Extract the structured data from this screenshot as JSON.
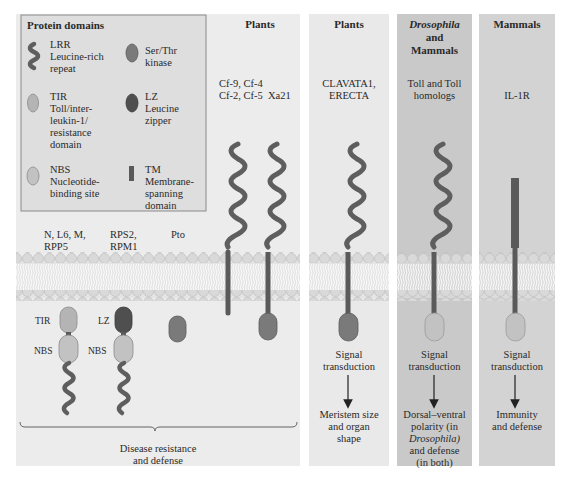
{
  "legend": {
    "title": "Protein domains",
    "items": [
      {
        "icon": "lrr-coil-icon",
        "abbr": "LRR",
        "name_lines": [
          "Leucine-rich",
          "repeat"
        ],
        "color": "#5e5e5e"
      },
      {
        "icon": "kinase-oval-icon",
        "abbr": "Ser/Thr",
        "name_lines": [
          "kinase"
        ],
        "color": "#7a7a7a"
      },
      {
        "icon": "tir-oval-icon",
        "abbr": "TIR",
        "name_lines": [
          "Toll/inter-",
          "leukin-1/",
          "resistance",
          "domain"
        ],
        "color": "#b4b4b4"
      },
      {
        "icon": "lz-oval-icon",
        "abbr": "LZ",
        "name_lines": [
          "Leucine",
          "zipper"
        ],
        "color": "#4f4f4f"
      },
      {
        "icon": "nbs-oval-icon",
        "abbr": "NBS",
        "name_lines": [
          "Nucleotide-",
          "binding site"
        ],
        "color": "#c2c2c2"
      },
      {
        "icon": "tm-bar-icon",
        "abbr": "TM",
        "name_lines": [
          "Membrane-",
          "spanning",
          "domain"
        ],
        "color": "#5a5a5a"
      }
    ]
  },
  "panels": [
    {
      "header": "Plants",
      "proteins": [
        {
          "label_lines": [
            "N, L6, M,",
            "RPP5"
          ],
          "domains": [
            "TIR",
            "NBS",
            "LRR"
          ],
          "domain_labels": [
            "TIR",
            "NBS"
          ]
        },
        {
          "label_lines": [
            "RPS2,",
            "RPM1"
          ],
          "domains": [
            "LZ",
            "NBS",
            "LRR"
          ],
          "domain_labels": [
            "LZ",
            "NBS"
          ]
        },
        {
          "label_lines": [
            "Pto"
          ],
          "domains": [
            "Ser/Thr kinase"
          ]
        },
        {
          "label_lines": [
            "Cf-9, Cf-4",
            "Cf-2, Cf-5"
          ],
          "domains": [
            "LRR",
            "TM"
          ]
        },
        {
          "label_lines": [
            "Xa21"
          ],
          "domains": [
            "LRR",
            "TM",
            "Ser/Thr kinase"
          ]
        }
      ],
      "function_lines": [
        "Disease resistance",
        "and defense"
      ]
    },
    {
      "header": "Plants",
      "proteins": [
        {
          "label_lines": [
            "CLAVATA1,",
            "ERECTA"
          ],
          "domains": [
            "LRR",
            "TM",
            "Ser/Thr kinase"
          ]
        }
      ],
      "signal_lines": [
        "Signal",
        "transduction"
      ],
      "function_lines": [
        "Meristem size",
        "and organ",
        "shape"
      ]
    },
    {
      "header_italic": "Drosophila",
      "header_lines": [
        "and",
        "Mammals"
      ],
      "proteins": [
        {
          "label_lines": [
            "Toll and Toll",
            "homologs"
          ],
          "domains": [
            "LRR",
            "TM",
            "TIR"
          ]
        }
      ],
      "signal_lines": [
        "Signal",
        "transduction"
      ],
      "function_lines": [
        "Dorsal–ventral",
        "polarity (in",
        "Drosophila)",
        "and defense",
        "(in both)"
      ]
    },
    {
      "header": "Mammals",
      "proteins": [
        {
          "label_lines": [
            "IL-1R"
          ],
          "domains": [
            "TM",
            "TIR"
          ]
        }
      ],
      "signal_lines": [
        "Signal",
        "transduction"
      ],
      "function_lines": [
        "Immunity",
        "and defense"
      ]
    }
  ],
  "colors": {
    "membrane_head": "#d6d6d6",
    "lrr": "#5e5e5e",
    "kinase": "#7a7a7a",
    "tir_nbs": "#b8b8b8",
    "lz": "#4f4f4f",
    "panel_light": "#ececec",
    "panel_dark": "#c9c9c9"
  }
}
